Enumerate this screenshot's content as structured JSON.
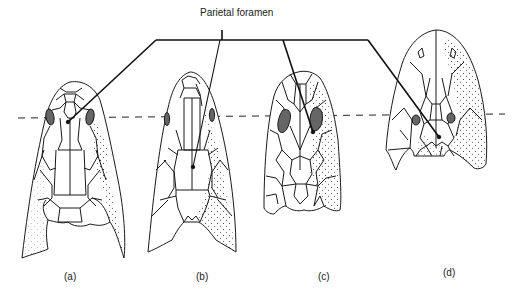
{
  "figure": {
    "pointer_label": "Parietal foramen",
    "reference_line": "dashed horizontal line through the orbits",
    "panels": [
      {
        "id": "a",
        "label": "(a)",
        "x": 72,
        "y": 272
      },
      {
        "id": "b",
        "label": "(b)",
        "x": 198,
        "y": 272
      },
      {
        "id": "c",
        "label": "(c)",
        "x": 322,
        "y": 272
      },
      {
        "id": "d",
        "label": "(d)",
        "x": 446,
        "y": 268
      }
    ]
  },
  "colors": {
    "ink": "#1a1a1a",
    "background": "#ffffff"
  }
}
